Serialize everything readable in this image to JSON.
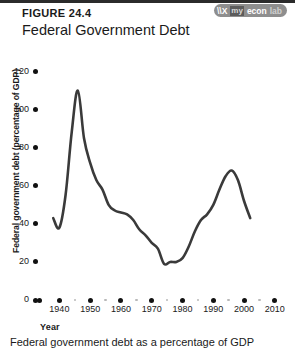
{
  "header": {
    "figure_number": "FIGURE 24.4",
    "title": "Federal Government Debt"
  },
  "logo": {
    "mark": "\\\\X",
    "my": "my",
    "econ": "econ",
    "lab": "lab"
  },
  "caption": "Federal government debt as a percentage of GDP",
  "chart_data": {
    "type": "line",
    "title": "Federal Government Debt",
    "xlabel": "Year",
    "ylabel": "Federal government debt (percentage of GDP)",
    "xlim": [
      1935,
      2012
    ],
    "ylim": [
      0,
      125
    ],
    "xticks": [
      "1940",
      "1950",
      "1960",
      "1970",
      "1980",
      "1990",
      "2000",
      "2010"
    ],
    "xtick_values": [
      1940,
      1950,
      1960,
      1970,
      1980,
      1990,
      2000,
      2010
    ],
    "xminor_values": [
      1945,
      1955,
      1965,
      1975,
      1985,
      1995,
      2005
    ],
    "yticks": [
      "0",
      "20",
      "40",
      "60",
      "80",
      "100",
      "120"
    ],
    "ytick_values": [
      0,
      20,
      40,
      60,
      80,
      100,
      120
    ],
    "grid": false,
    "legend": null,
    "line_color": "#3a3a3a",
    "series": [
      {
        "name": "Federal government debt as a percentage of GDP",
        "x": [
          1938,
          1940,
          1942,
          1944,
          1946,
          1948,
          1950,
          1952,
          1954,
          1956,
          1958,
          1960,
          1962,
          1964,
          1966,
          1968,
          1970,
          1972,
          1974,
          1976,
          1978,
          1980,
          1982,
          1984,
          1986,
          1988,
          1990,
          1992,
          1994,
          1996,
          1998,
          2000,
          2002
        ],
        "y": [
          43,
          38,
          55,
          88,
          110,
          85,
          72,
          63,
          58,
          50,
          47,
          46,
          45,
          42,
          37,
          34,
          30,
          27,
          19,
          20,
          20,
          22,
          28,
          36,
          42,
          45,
          50,
          58,
          65,
          68,
          63,
          52,
          43
        ]
      }
    ]
  }
}
